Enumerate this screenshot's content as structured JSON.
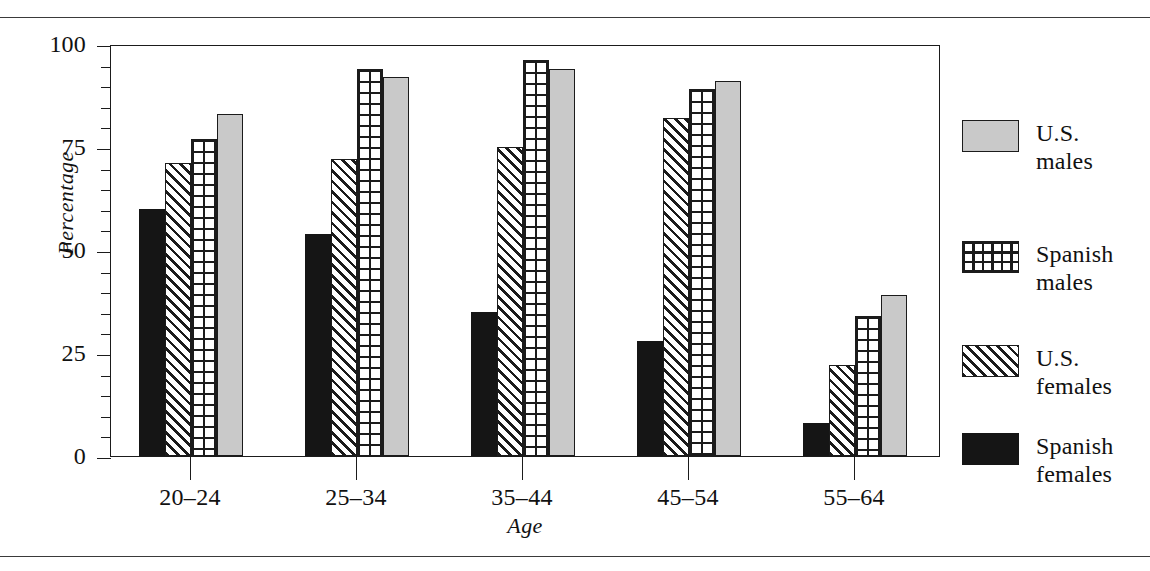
{
  "chart_data": {
    "type": "bar",
    "title": "",
    "xlabel": "Age",
    "ylabel": "Percentage",
    "categories": [
      "20–24",
      "25–34",
      "35–44",
      "45–54",
      "55–64"
    ],
    "ylim": [
      0,
      100
    ],
    "ytick_labels": [
      "0",
      "25",
      "50",
      "75",
      "100"
    ],
    "ytick_values": [
      0,
      25,
      50,
      75,
      100
    ],
    "yminor_step": 5,
    "grid": false,
    "legend_position": "right",
    "series": [
      {
        "name": "Spanish\nfemales",
        "pattern": "solid-black",
        "color": "#151515",
        "values": [
          60,
          54,
          35,
          28,
          8
        ]
      },
      {
        "name": "U.S.\nfemales",
        "pattern": "diagonal",
        "color": "#ffffff",
        "values": [
          71,
          72,
          75,
          82,
          22
        ]
      },
      {
        "name": "Spanish\nmales",
        "pattern": "crosshatch",
        "color": "#ffffff",
        "values": [
          77,
          94,
          96,
          89,
          34
        ]
      },
      {
        "name": "U.S.\nmales",
        "pattern": "solid-gray",
        "color": "#c9c9c9",
        "values": [
          83,
          92,
          94,
          91,
          39
        ]
      }
    ]
  },
  "legend": {
    "entries": [
      {
        "label": "U.S.\nmales",
        "pattern": "solid-gray"
      },
      {
        "label": "Spanish\nmales",
        "pattern": "crosshatch"
      },
      {
        "label": "U.S.\nfemales",
        "pattern": "diagonal"
      },
      {
        "label": "Spanish\nfemales",
        "pattern": "solid-black"
      }
    ]
  },
  "axes": {
    "y_title": "Percentage",
    "x_title": "Age"
  }
}
